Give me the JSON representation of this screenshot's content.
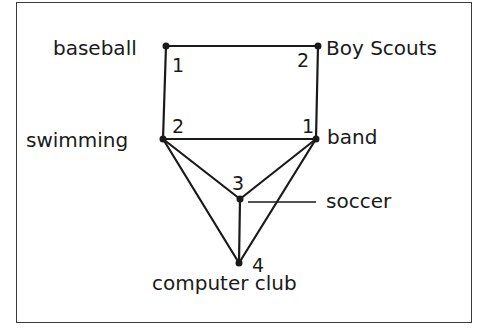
{
  "diagram": {
    "type": "graph",
    "nodes": [
      {
        "id": "baseball",
        "label": "baseball",
        "color_number": "1",
        "x": 166,
        "y": 46
      },
      {
        "id": "boy_scouts",
        "label": "Boy Scouts",
        "color_number": "2",
        "x": 318,
        "y": 46
      },
      {
        "id": "swimming",
        "label": "swimming",
        "color_number": "2",
        "x": 163,
        "y": 139
      },
      {
        "id": "band",
        "label": "band",
        "color_number": "1",
        "x": 316,
        "y": 139
      },
      {
        "id": "soccer",
        "label": "soccer",
        "color_number": "3",
        "x": 240,
        "y": 199
      },
      {
        "id": "computer_club",
        "label": "computer club",
        "color_number": "4",
        "x": 239,
        "y": 263
      }
    ],
    "edges": [
      [
        "baseball",
        "boy_scouts"
      ],
      [
        "baseball",
        "swimming"
      ],
      [
        "boy_scouts",
        "band"
      ],
      [
        "swimming",
        "band"
      ],
      [
        "swimming",
        "soccer"
      ],
      [
        "swimming",
        "computer_club"
      ],
      [
        "band",
        "soccer"
      ],
      [
        "band",
        "computer_club"
      ],
      [
        "soccer",
        "computer_club"
      ]
    ],
    "line_color": "#1a1a1a"
  }
}
